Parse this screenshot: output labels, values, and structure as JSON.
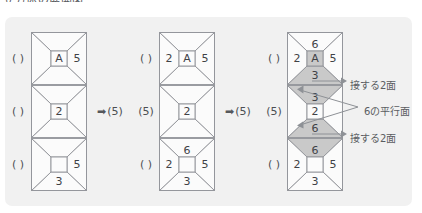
{
  "heading": "立方体の展開図",
  "colors": {
    "panel_bg": "#f1f1f1",
    "net_bg": "#fbfbfb",
    "stroke": "#8e9196",
    "shade": "#c9c9c9",
    "text": "#3f4246"
  },
  "nets": [
    {
      "name": "net-1",
      "left_labels": [
        "( )",
        "( )",
        "( )"
      ],
      "cells": [
        {
          "center": "A",
          "center_boxed": true,
          "right": "5",
          "left": "",
          "top": "",
          "bottom": "",
          "shaded": []
        },
        {
          "center": "2",
          "center_boxed": true,
          "right": "",
          "left": "",
          "top": "",
          "bottom": "",
          "shaded": []
        },
        {
          "center": "",
          "center_boxed": true,
          "right": "5",
          "left": "",
          "top": "",
          "bottom": "3",
          "shaded": []
        }
      ]
    },
    {
      "name": "net-2",
      "left_labels": [
        "( )",
        "(5)",
        "( )"
      ],
      "cells": [
        {
          "center": "A",
          "center_boxed": true,
          "right": "5",
          "left": "2",
          "top": "",
          "bottom": "",
          "shaded": []
        },
        {
          "center": "2",
          "center_boxed": true,
          "right": "",
          "left": "",
          "top": "",
          "bottom": "",
          "shaded": []
        },
        {
          "center": "",
          "center_boxed": true,
          "right": "5",
          "left": "2",
          "top": "6",
          "bottom": "3",
          "shaded": []
        }
      ]
    },
    {
      "name": "net-3",
      "left_labels": [
        "( )",
        "(5)",
        "( )"
      ],
      "cells": [
        {
          "center": "A",
          "center_boxed": true,
          "right": "5",
          "left": "2",
          "top": "6",
          "bottom": "3",
          "shaded": [
            "center",
            "bottom"
          ]
        },
        {
          "center": "2",
          "center_boxed": true,
          "right": "",
          "left": "",
          "top": "3",
          "bottom": "6",
          "shaded": [
            "top",
            "bottom"
          ]
        },
        {
          "center": "",
          "center_boxed": true,
          "right": "5",
          "left": "2",
          "top": "6",
          "bottom": "3",
          "shaded": [
            "top"
          ]
        }
      ]
    }
  ],
  "separators": [
    {
      "arrow": "➡",
      "label": "(5)"
    },
    {
      "arrow": "➡",
      "label": "(5)"
    }
  ],
  "annotations": [
    {
      "name": "anno-touching-top",
      "text": "接する2面"
    },
    {
      "name": "anno-parallel-of-six",
      "text": "6の平行面"
    },
    {
      "name": "anno-touching-bottom",
      "text": "接する2面"
    }
  ]
}
